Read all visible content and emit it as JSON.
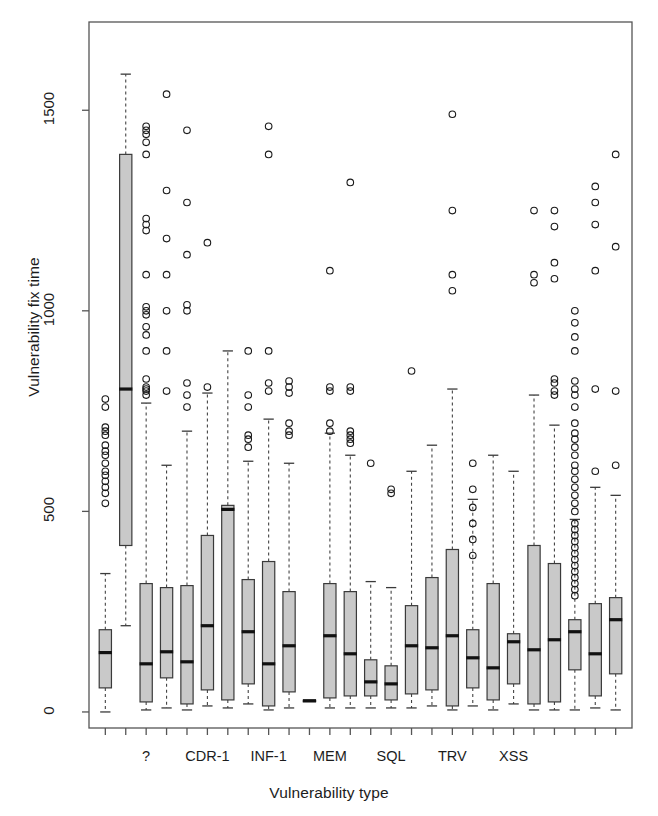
{
  "chart_data": {
    "type": "boxplot",
    "title": "",
    "xlabel": "Vulnerability type",
    "ylabel": "Vulnerability fix time",
    "ylim": [
      -40,
      1720
    ],
    "yticks": [
      0,
      500,
      1000,
      1500
    ],
    "ytick_labels": [
      "0",
      "500",
      "1000",
      "1500"
    ],
    "grid": false,
    "legend": null,
    "n_groups": 26,
    "xtick_labels": [
      "",
      "",
      "?",
      "",
      "CDR-1",
      "",
      "INF-1",
      "",
      "MEM",
      "",
      "SQL",
      "",
      "TRV",
      "",
      "XSS",
      ""
    ],
    "xtick_label_positions": [
      2,
      5,
      8,
      11,
      14,
      17,
      20
    ],
    "xtick_labels_shown": [
      "?",
      "CDR-1",
      "INF-1",
      "MEM",
      "SQL",
      "TRV",
      "XSS"
    ],
    "box_fill": "#c9c9c9",
    "box_stroke": "#3a3a3a",
    "median_color": "#111111",
    "outlier_shape": "circle-open",
    "boxes": [
      {
        "name": "g1",
        "q1": 60,
        "median": 148,
        "q3": 205,
        "lower": 0,
        "upper": 345,
        "outliers": [
          520,
          545,
          560,
          575,
          590,
          600,
          620,
          640,
          650,
          665,
          690,
          700,
          710,
          760,
          780
        ]
      },
      {
        "name": "g2",
        "q1": 415,
        "median": 805,
        "q3": 1390,
        "lower": 215,
        "upper": 1590,
        "outliers": []
      },
      {
        "name": "g3",
        "q1": 25,
        "median": 120,
        "q3": 320,
        "lower": 5,
        "upper": 770,
        "outliers": [
          790,
          800,
          805,
          810,
          830,
          900,
          940,
          960,
          990,
          1000,
          1010,
          1090,
          1200,
          1215,
          1230,
          1390,
          1420,
          1440,
          1450,
          1460
        ]
      },
      {
        "name": "g4",
        "q1": 85,
        "median": 150,
        "q3": 310,
        "lower": 10,
        "upper": 615,
        "outliers": [
          800,
          900,
          1000,
          1090,
          1180,
          1300,
          1540
        ]
      },
      {
        "name": "g5",
        "q1": 20,
        "median": 125,
        "q3": 315,
        "lower": 5,
        "upper": 700,
        "outliers": [
          760,
          790,
          820,
          1000,
          1015,
          1140,
          1270,
          1450
        ]
      },
      {
        "name": "g6",
        "q1": 55,
        "median": 215,
        "q3": 440,
        "lower": 15,
        "upper": 795,
        "outliers": [
          810,
          1170
        ]
      },
      {
        "name": "g7",
        "q1": 30,
        "median": 505,
        "q3": 515,
        "lower": 10,
        "upper": 900,
        "outliers": []
      },
      {
        "name": "g8",
        "q1": 70,
        "median": 200,
        "q3": 330,
        "lower": 20,
        "upper": 625,
        "outliers": [
          660,
          680,
          690,
          760,
          790,
          900
        ]
      },
      {
        "name": "g9",
        "q1": 15,
        "median": 120,
        "q3": 375,
        "lower": 5,
        "upper": 730,
        "outliers": [
          800,
          820,
          900,
          1390,
          1460
        ]
      },
      {
        "name": "g10",
        "q1": 50,
        "median": 165,
        "q3": 300,
        "lower": 10,
        "upper": 620,
        "outliers": [
          690,
          700,
          720,
          795,
          810,
          825
        ]
      },
      {
        "name": "g11",
        "q1": 28,
        "median": 28,
        "q3": 28,
        "lower": 28,
        "upper": 28,
        "outliers": []
      },
      {
        "name": "g12",
        "q1": 35,
        "median": 190,
        "q3": 320,
        "lower": 10,
        "upper": 695,
        "outliers": [
          700,
          720,
          800,
          810,
          1100
        ]
      },
      {
        "name": "g13",
        "q1": 40,
        "median": 145,
        "q3": 300,
        "lower": 10,
        "upper": 640,
        "outliers": [
          670,
          680,
          690,
          700,
          800,
          810,
          1320
        ]
      },
      {
        "name": "g14",
        "q1": 40,
        "median": 75,
        "q3": 130,
        "lower": 10,
        "upper": 325,
        "outliers": [
          620
        ]
      },
      {
        "name": "g15",
        "q1": 30,
        "median": 70,
        "q3": 115,
        "lower": 10,
        "upper": 310,
        "outliers": [
          545,
          555
        ]
      },
      {
        "name": "g16",
        "q1": 45,
        "median": 165,
        "q3": 265,
        "lower": 10,
        "upper": 600,
        "outliers": [
          850
        ]
      },
      {
        "name": "g17",
        "q1": 55,
        "median": 160,
        "q3": 335,
        "lower": 15,
        "upper": 665,
        "outliers": []
      },
      {
        "name": "g18",
        "q1": 15,
        "median": 190,
        "q3": 405,
        "lower": 5,
        "upper": 805,
        "outliers": [
          1050,
          1090,
          1250,
          1490
        ]
      },
      {
        "name": "g19",
        "q1": 60,
        "median": 135,
        "q3": 205,
        "lower": 15,
        "upper": 530,
        "outliers": [
          390,
          430,
          470,
          510,
          555,
          620
        ]
      },
      {
        "name": "g20",
        "q1": 30,
        "median": 110,
        "q3": 320,
        "lower": 5,
        "upper": 640,
        "outliers": []
      },
      {
        "name": "g21",
        "q1": 70,
        "median": 175,
        "q3": 195,
        "lower": 20,
        "upper": 600,
        "outliers": []
      },
      {
        "name": "g22",
        "q1": 20,
        "median": 155,
        "q3": 415,
        "lower": 5,
        "upper": 790,
        "outliers": [
          1070,
          1090,
          1250
        ]
      },
      {
        "name": "g23",
        "q1": 25,
        "median": 180,
        "q3": 370,
        "lower": 5,
        "upper": 715,
        "outliers": [
          790,
          800,
          820,
          830,
          1080,
          1120,
          1210,
          1250
        ]
      },
      {
        "name": "g24",
        "q1": 105,
        "median": 200,
        "q3": 230,
        "lower": 5,
        "upper": 480,
        "outliers": [
          290,
          305,
          320,
          335,
          350,
          365,
          380,
          395,
          410,
          425,
          440,
          455,
          470,
          500,
          520,
          540,
          560,
          580,
          600,
          615,
          640,
          660,
          680,
          695,
          720,
          760,
          790,
          805,
          825,
          900,
          935,
          970,
          1000
        ]
      },
      {
        "name": "g25",
        "q1": 40,
        "median": 145,
        "q3": 270,
        "lower": 10,
        "upper": 560,
        "outliers": [
          600,
          805,
          1100,
          1215,
          1270,
          1310
        ]
      },
      {
        "name": "g26",
        "q1": 95,
        "median": 230,
        "q3": 285,
        "lower": 5,
        "upper": 540,
        "outliers": [
          615,
          800,
          1160,
          1390
        ]
      }
    ]
  },
  "axes": {
    "ytitle": "Vulnerability fix time",
    "xtitle": "Vulnerability type"
  }
}
